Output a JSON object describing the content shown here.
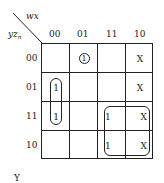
{
  "kmap": {
    "col_var": "wx",
    "row_var": "yz",
    "row_var_sub": "n",
    "col_headers": [
      "00",
      "01",
      "11",
      "10"
    ],
    "row_headers": [
      "00",
      "01",
      "11",
      "10"
    ],
    "cells": [
      [
        "",
        "1",
        "",
        "X"
      ],
      [
        "1",
        "",
        "",
        "X"
      ],
      [
        "1",
        "",
        "1",
        "X"
      ],
      [
        "",
        "",
        "1",
        "X"
      ]
    ],
    "circled_cells": [
      [
        0,
        1
      ]
    ],
    "groups": [
      {
        "cells": [
          [
            1,
            0
          ],
          [
            2,
            0
          ]
        ],
        "description": "vertical pair in column 00, rows 01-11"
      },
      {
        "cells": [
          [
            2,
            2
          ],
          [
            2,
            3
          ],
          [
            3,
            2
          ],
          [
            3,
            3
          ]
        ],
        "description": "quad in columns 11-10, rows 11-10"
      }
    ],
    "caption": "Y"
  }
}
